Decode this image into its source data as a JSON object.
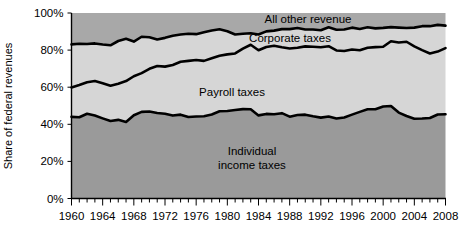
{
  "chart_data": {
    "type": "area",
    "title": "",
    "subtitle": "",
    "xlabel": "",
    "ylabel": "Share of federal revenues",
    "stacked": true,
    "grid": false,
    "legend_position": "inline-annotations",
    "xlim": [
      1960,
      2008
    ],
    "ylim": [
      0,
      100
    ],
    "y_ticks": [
      "0%",
      "20%",
      "40%",
      "60%",
      "80%",
      "100%"
    ],
    "y_tick_values": [
      0,
      20,
      40,
      60,
      80,
      100
    ],
    "x_ticks": [
      "1960",
      "1964",
      "1968",
      "1972",
      "1976",
      "1980",
      "1984",
      "1988",
      "1992",
      "1996",
      "2000",
      "2004",
      "2008"
    ],
    "x_tick_values": [
      1960,
      1964,
      1968,
      1972,
      1976,
      1980,
      1984,
      1988,
      1992,
      1996,
      2000,
      2004,
      2008
    ],
    "x_minor_tick_interval": 1,
    "colors": {
      "individual_income_taxes": "#9a9a9a",
      "payroll_taxes": "#d6d6d6",
      "corporate_taxes": "#d6d6d6",
      "all_other_revenue": "#a8a8a8",
      "boundary_line": "#000000",
      "axis": "#000000",
      "background": "#ffffff"
    },
    "x": [
      1960,
      1961,
      1962,
      1963,
      1964,
      1965,
      1966,
      1967,
      1968,
      1969,
      1970,
      1971,
      1972,
      1973,
      1974,
      1975,
      1976,
      1977,
      1978,
      1979,
      1980,
      1981,
      1982,
      1983,
      1984,
      1985,
      1986,
      1987,
      1988,
      1989,
      1990,
      1991,
      1992,
      1993,
      1994,
      1995,
      1996,
      1997,
      1998,
      1999,
      2000,
      2001,
      2002,
      2003,
      2004,
      2005,
      2006,
      2007,
      2008
    ],
    "series": [
      {
        "name": "Individual income taxes",
        "label": "Individual\nincome taxes",
        "label_line1": "Individual",
        "label_line2": "income taxes",
        "values": [
          44.0,
          43.8,
          45.7,
          44.7,
          43.2,
          41.8,
          42.4,
          41.3,
          44.9,
          46.7,
          46.9,
          46.1,
          45.7,
          44.7,
          45.2,
          43.9,
          44.2,
          44.3,
          45.3,
          47.0,
          47.2,
          47.7,
          48.2,
          48.1,
          44.8,
          45.6,
          45.4,
          46.0,
          44.1,
          45.0,
          45.2,
          44.3,
          43.6,
          44.2,
          43.1,
          43.7,
          45.2,
          46.7,
          48.1,
          48.1,
          49.6,
          49.9,
          46.3,
          44.5,
          43.0,
          43.1,
          43.4,
          45.3,
          45.4
        ]
      },
      {
        "name": "Payroll taxes",
        "label": "Payroll taxes",
        "values": [
          15.9,
          17.4,
          17.0,
          18.6,
          18.9,
          19.0,
          19.5,
          22.0,
          21.0,
          20.9,
          23.0,
          25.3,
          25.4,
          27.3,
          28.5,
          30.3,
          30.5,
          29.9,
          30.3,
          30.0,
          30.5,
          30.5,
          32.6,
          34.8,
          35.1,
          36.1,
          36.9,
          35.5,
          36.8,
          36.3,
          36.8,
          37.5,
          37.9,
          37.9,
          36.7,
          35.8,
          35.1,
          33.2,
          33.2,
          33.5,
          32.2,
          34.9,
          37.8,
          40.0,
          39.0,
          36.9,
          34.8,
          33.9,
          35.7
        ]
      },
      {
        "name": "Corporate taxes",
        "label": "Corporate taxes",
        "values": [
          23.2,
          22.2,
          20.6,
          20.3,
          20.9,
          21.8,
          23.0,
          22.8,
          18.7,
          19.6,
          17.0,
          14.3,
          15.5,
          15.7,
          14.7,
          14.6,
          13.9,
          15.4,
          15.0,
          14.2,
          12.5,
          10.2,
          8.0,
          6.2,
          8.5,
          8.4,
          8.2,
          9.8,
          10.4,
          10.6,
          9.1,
          9.3,
          9.2,
          10.2,
          11.2,
          11.6,
          11.8,
          11.5,
          11.0,
          10.1,
          10.2,
          7.6,
          8.0,
          7.4,
          10.1,
          12.9,
          14.7,
          14.4,
          12.1
        ]
      },
      {
        "name": "All other revenue",
        "label": "All other revenue",
        "values": [
          16.9,
          16.6,
          16.7,
          16.4,
          17.0,
          17.4,
          15.1,
          13.9,
          15.4,
          12.8,
          13.1,
          14.3,
          13.4,
          12.3,
          11.6,
          11.2,
          11.4,
          10.4,
          9.4,
          8.8,
          9.8,
          11.6,
          11.2,
          10.9,
          11.6,
          9.9,
          9.5,
          8.7,
          8.7,
          8.1,
          8.9,
          8.9,
          9.3,
          7.7,
          9.0,
          8.9,
          7.9,
          8.6,
          7.7,
          8.3,
          8.0,
          7.6,
          7.9,
          8.1,
          7.9,
          7.1,
          7.1,
          6.4,
          6.8
        ]
      }
    ],
    "cumulative_boundaries": {
      "note": "stacked upper edges, percent of federal revenues",
      "individual_top": [
        44.0,
        43.8,
        45.7,
        44.7,
        43.2,
        41.8,
        42.4,
        41.3,
        44.9,
        46.7,
        46.9,
        46.1,
        45.7,
        44.7,
        45.2,
        43.9,
        44.2,
        44.3,
        45.3,
        47.0,
        47.2,
        47.7,
        48.2,
        48.1,
        44.8,
        45.6,
        45.4,
        46.0,
        44.1,
        45.0,
        45.2,
        44.3,
        43.6,
        44.2,
        43.1,
        43.7,
        45.2,
        46.7,
        48.1,
        48.1,
        49.6,
        49.9,
        46.3,
        44.5,
        43.0,
        43.1,
        43.4,
        45.3,
        45.4
      ],
      "payroll_top": [
        59.9,
        61.2,
        62.7,
        63.3,
        62.1,
        60.8,
        61.9,
        63.3,
        65.9,
        67.6,
        69.9,
        71.4,
        71.1,
        72.0,
        73.7,
        74.2,
        74.7,
        74.2,
        75.6,
        77.0,
        77.7,
        78.2,
        80.8,
        82.9,
        79.9,
        81.7,
        82.3,
        81.5,
        80.9,
        81.3,
        82.0,
        81.8,
        81.5,
        82.1,
        79.8,
        79.5,
        80.3,
        79.9,
        81.3,
        81.6,
        81.8,
        84.8,
        84.1,
        84.5,
        82.0,
        80.0,
        78.2,
        79.2,
        81.1
      ],
      "corporate_top": [
        83.1,
        83.4,
        83.3,
        83.6,
        83.0,
        82.6,
        84.9,
        86.1,
        84.6,
        87.2,
        86.9,
        85.7,
        86.6,
        87.7,
        88.4,
        88.8,
        88.6,
        89.6,
        90.6,
        91.2,
        90.2,
        88.4,
        88.8,
        89.1,
        88.4,
        90.1,
        90.5,
        91.3,
        91.3,
        91.9,
        91.1,
        91.1,
        90.7,
        92.3,
        91.0,
        91.1,
        92.1,
        91.4,
        92.3,
        91.7,
        92.0,
        92.4,
        92.1,
        91.9,
        92.1,
        92.9,
        92.9,
        93.6,
        93.2
      ]
    }
  }
}
